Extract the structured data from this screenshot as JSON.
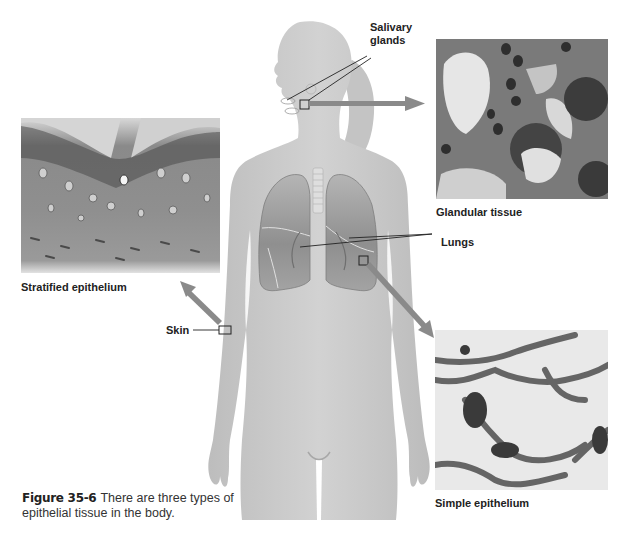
{
  "figure": {
    "number": "Figure 35-6",
    "caption_text": "There are three types of epithelial tissue in the body."
  },
  "labels": {
    "salivary_glands_line1": "Salivary",
    "salivary_glands_line2": "glands",
    "lungs": "Lungs",
    "skin": "Skin"
  },
  "micrographs": [
    {
      "id": "stratified",
      "caption": "Stratified epithelium",
      "source": "Skin"
    },
    {
      "id": "glandular",
      "caption": "Glandular tissue",
      "source": "Salivary glands"
    },
    {
      "id": "simple",
      "caption": "Simple epithelium",
      "source": "Lungs"
    }
  ],
  "colors": {
    "body_fill": "#c9c9c9",
    "body_shade": "#b3b3b3",
    "arrow": "#8a8a8a",
    "lung_fill": "#9d9d9d",
    "label_text": "#222222"
  }
}
